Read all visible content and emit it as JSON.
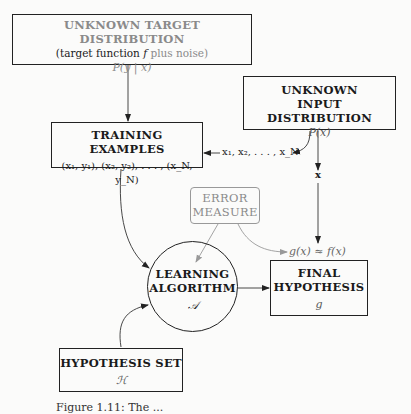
{
  "target_distribution": {
    "title": "UNKNOWN TARGET DISTRIBUTION",
    "subtitle_prefix": "(target function ",
    "subtitle_f": "f",
    "subtitle_noise": " plus noise)",
    "formula": "P(y | x)"
  },
  "input_distribution": {
    "title_line1": "UNKNOWN",
    "title_line2": "INPUT DISTRIBUTION",
    "formula": "P(x)"
  },
  "training_examples": {
    "title": "TRAINING EXAMPLES",
    "formula": "(x₁, y₁), (x₂, y₂), . . . , (x_N, y_N)"
  },
  "inputs_label": "x₁, x₂, . . . , x_N",
  "x_label": "x",
  "error_measure": {
    "line1": "ERROR",
    "line2": "MEASURE"
  },
  "approx_label": "g(x) ≈ f(x)",
  "learning_algorithm": {
    "line1": "LEARNING",
    "line2": "ALGORITHM",
    "symbol": "𝒜"
  },
  "final_hypothesis": {
    "line1": "FINAL",
    "line2": "HYPOTHESIS",
    "symbol": "g"
  },
  "hypothesis_set": {
    "title": "HYPOTHESIS SET",
    "symbol": "ℋ"
  },
  "caption": "Figure 1.11: The ...",
  "colors": {
    "ink": "#1a1a1a",
    "gray": "#8a8a8a",
    "background": "#fbfbfa"
  }
}
